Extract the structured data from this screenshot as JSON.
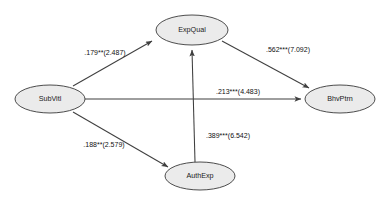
{
  "figure": {
    "type": "path-diagram",
    "background_color": "#ffffff",
    "node_fill_color": "#ebebeb",
    "node_stroke_color": "#3a3a3a",
    "edge_color": "#3f3f3f",
    "label_color": "#111111"
  },
  "nodes": [
    {
      "id": "subvitl",
      "label": "SubVitl",
      "cx": 50,
      "cy": 99,
      "rx": 35,
      "ry": 14
    },
    {
      "id": "expqual",
      "label": "ExpQual",
      "cx": 192,
      "cy": 30,
      "rx": 36,
      "ry": 15
    },
    {
      "id": "authexp",
      "label": "AuthExp",
      "cx": 200,
      "cy": 176,
      "rx": 35,
      "ry": 14
    },
    {
      "id": "bhvptrn",
      "label": "BhvPtrn",
      "cx": 340,
      "cy": 99,
      "rx": 35,
      "ry": 14
    }
  ],
  "edges": [
    {
      "id": "subvitl-expqual",
      "from": "SubVitl",
      "to": "ExpQual",
      "label": ".179**(2.487)",
      "coefficient": ".179",
      "significance": "**",
      "t_value": "2.487",
      "label_x": 105,
      "label_y": 53
    },
    {
      "id": "subvitl-authexp",
      "from": "SubVitl",
      "to": "AuthExp",
      "label": ".188**(2.579)",
      "coefficient": ".188",
      "significance": "**",
      "t_value": "2.579",
      "label_x": 104,
      "label_y": 145
    },
    {
      "id": "subvitl-bhvptrn",
      "from": "SubVitl",
      "to": "BhvPtrn",
      "label": ".213***(4.483)",
      "coefficient": ".213",
      "significance": "***",
      "t_value": "4.483",
      "label_x": 238,
      "label_y": 92
    },
    {
      "id": "expqual-bhvptrn",
      "from": "ExpQual",
      "to": "BhvPtrn",
      "label": ".562***(7.092)",
      "coefficient": ".562",
      "significance": "***",
      "t_value": "7.092",
      "label_x": 288,
      "label_y": 50
    },
    {
      "id": "authexp-expqual",
      "from": "AuthExp",
      "to": "ExpQual",
      "label": ".389***(6.542)",
      "coefficient": ".389",
      "significance": "***",
      "t_value": "6.542",
      "label_x": 228,
      "label_y": 136
    }
  ]
}
